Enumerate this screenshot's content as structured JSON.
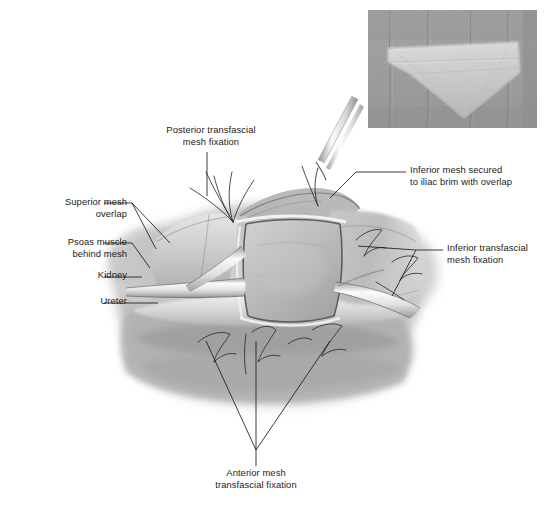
{
  "figure": {
    "type": "medical-surgical-illustration",
    "background_color": "#ffffff",
    "ink_color": "#1b1b1b"
  },
  "labels": [
    {
      "id": "superior-mesh-overlap",
      "text": "Superior mesh\noverlap",
      "align": "right",
      "leader": "branched-two"
    },
    {
      "id": "psoas-muscle-behind-mesh",
      "text": "Psoas muscle\nbehind mesh",
      "align": "right",
      "leader": "angled"
    },
    {
      "id": "kidney",
      "text": "Kidney",
      "align": "right",
      "leader": "straight"
    },
    {
      "id": "ureter",
      "text": "Ureter",
      "align": "right",
      "leader": "straight"
    },
    {
      "id": "posterior-transfascial-mesh-fixation",
      "text": "Posterior transfascial\nmesh fixation",
      "align": "center",
      "leader": "vertical"
    },
    {
      "id": "inferior-mesh-secured-to-iliac-brim",
      "text": "Inferior mesh secured\nto iliac brim with overlap",
      "align": "left",
      "leader": "angled"
    },
    {
      "id": "inferior-transfascial-mesh-fixation",
      "text": "Inferior transfascial\nmesh fixation",
      "align": "left",
      "leader": "branched-two"
    },
    {
      "id": "anterior-mesh-transfascial-fixation",
      "text": "Anterior mesh\ntransfascial fixation",
      "align": "center",
      "leader": "branched-three"
    }
  ],
  "inset": {
    "id": "intraoperative-photograph",
    "description": "grayscale intraoperative photograph of mesh sheet laid over tissue",
    "border_color": "#8d8d8d"
  },
  "anatomy": {
    "structures": [
      "psoas muscle",
      "kidney",
      "ureter",
      "iliac brim",
      "mesh sheet",
      "transfascial sutures",
      "suture passer instrument"
    ]
  }
}
